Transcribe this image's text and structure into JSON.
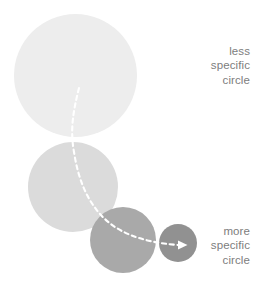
{
  "diagram": {
    "background_color": "#ffffff",
    "circles": [
      {
        "id": "circle-1",
        "name": "largest-circle",
        "diameter": 123,
        "x": 14,
        "y": 14,
        "color": "#ededed",
        "specificity": "least"
      },
      {
        "id": "circle-2",
        "name": "large-circle",
        "diameter": 90,
        "x": 28,
        "y": 142,
        "color": "#dbdbdb",
        "specificity": "less"
      },
      {
        "id": "circle-3",
        "name": "medium-circle",
        "diameter": 66,
        "x": 90,
        "y": 207,
        "color": "#a9a9a9",
        "specificity": "more"
      },
      {
        "id": "circle-4",
        "name": "smallest-circle",
        "diameter": 38,
        "x": 159,
        "y": 224,
        "color": "#919191",
        "specificity": "most"
      }
    ],
    "arrow": {
      "name": "dashed-flow-arrow",
      "color": "#ffffff",
      "style": "dashed",
      "direction": "top-left-to-bottom-right",
      "has_arrowhead": true
    },
    "labels": {
      "top": {
        "name": "less-specific-label",
        "text": "less\nspecific\ncircle",
        "color": "#7d7d7d"
      },
      "bottom": {
        "name": "more-specific-label",
        "text": "more\nspecific\ncircle",
        "color": "#7d7d7d"
      }
    }
  }
}
